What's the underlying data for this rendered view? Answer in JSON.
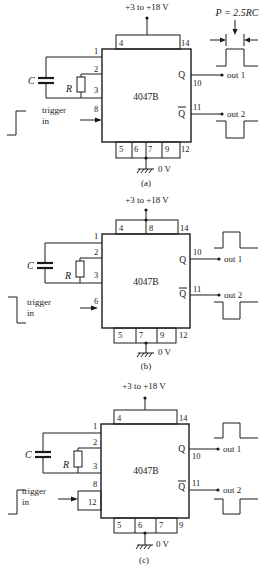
{
  "diagrams": [
    {
      "id": "a",
      "caption": "(a)",
      "supply_label": "+3 to +18 V",
      "ground_label": "0 V",
      "chip_label": "4047B",
      "capacitor_label": "C",
      "resistor_label": "R",
      "trigger_label_1": "trigger",
      "trigger_label_2": "in",
      "trigger_pin": "8",
      "trigger_waveform": "rising-edge",
      "top_pins": [
        "4",
        "14"
      ],
      "left_pins": [
        "1",
        "2",
        "3"
      ],
      "bottom_pins": [
        "5",
        "6",
        "7",
        "9",
        "12"
      ],
      "q_label": "Q",
      "qbar_label": "Q",
      "q_pin": "10",
      "qbar_pin": "11",
      "out1_label": "out 1",
      "out2_label": "out 2",
      "pulse_annotation": "P = 2.5RC"
    },
    {
      "id": "b",
      "caption": "(b)",
      "supply_label": "+3 to +18 V",
      "ground_label": "0 V",
      "chip_label": "4047B",
      "capacitor_label": "C",
      "resistor_label": "R",
      "trigger_label_1": "trigger",
      "trigger_label_2": "in",
      "trigger_pin": "6",
      "trigger_waveform": "falling-edge",
      "top_pins": [
        "4",
        "8",
        "14"
      ],
      "left_pins": [
        "1",
        "2",
        "3"
      ],
      "bottom_pins": [
        "5",
        "7",
        "9",
        "12"
      ],
      "q_label": "Q",
      "qbar_label": "Q",
      "q_pin": "10",
      "qbar_pin": "11",
      "out1_label": "out 1",
      "out2_label": "out 2"
    },
    {
      "id": "c",
      "caption": "(c)",
      "supply_label": "+3 to +18 V",
      "ground_label": "0 V",
      "chip_label": "4047B",
      "capacitor_label": "C",
      "resistor_label": "R",
      "trigger_label_1": "trigger",
      "trigger_label_2": "in",
      "trigger_pins": [
        "8",
        "12"
      ],
      "trigger_waveform": "rising-edge",
      "top_pins": [
        "4",
        "14"
      ],
      "left_pins": [
        "1",
        "2",
        "3"
      ],
      "bottom_pins": [
        "5",
        "6",
        "7",
        "9"
      ],
      "q_label": "Q",
      "qbar_label": "Q",
      "q_pin": "10",
      "qbar_pin": "11",
      "out1_label": "out 1",
      "out2_label": "out 2"
    }
  ]
}
